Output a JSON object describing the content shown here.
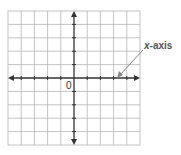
{
  "diagram": {
    "type": "coordinate-plane",
    "grid": {
      "columns": 10,
      "rows": 10,
      "cell_px": 13.2,
      "left": 8,
      "top": 11,
      "right": 140,
      "bottom": 145
    },
    "axis_color": "#333333",
    "grid_color": "#b5b5b5",
    "annotation_color": "#888888",
    "origin_label": "0",
    "x_axis_label_prefix": "x",
    "x_axis_label_suffix": "-axis"
  }
}
